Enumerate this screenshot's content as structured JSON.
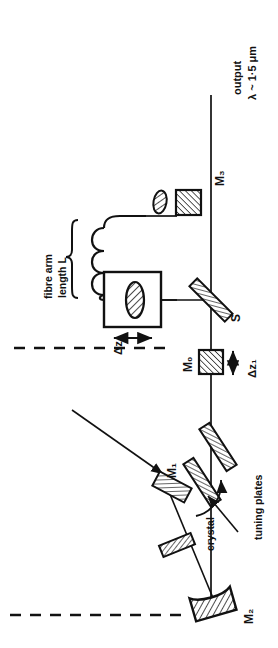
{
  "figure": {
    "kind": "optical-cavity-schematic",
    "orientation": "rotated-90-ccw",
    "background": "#ffffff",
    "ink": "#111111"
  },
  "labels": {
    "output": "output",
    "wavelength": "λ ~ 1·5 μm",
    "mirror_m3": "M₃",
    "mirror_m0": "M₀",
    "mirror_m1": "M₁",
    "mirror_m2": "M₂",
    "beamsplitter_s": "S",
    "fibre_arm_line1": "fibre arm",
    "fibre_arm_line2": "length L",
    "delta_z2": "Δz₂",
    "delta_z1": "Δz₁",
    "crystal": "crystal",
    "tuning_plates": "tuning plates"
  },
  "components": [
    {
      "id": "m3",
      "name": "mirror-m3",
      "label": "M₃",
      "style": "hatched-square"
    },
    {
      "id": "fibre-coil",
      "name": "fibre-coil",
      "label": "fibre arm length L",
      "style": "coil"
    },
    {
      "id": "fibre-endface",
      "name": "fibre-end-element",
      "label": "",
      "style": "hatched-ellipse"
    },
    {
      "id": "dz2-box",
      "name": "translation-stage-z2",
      "label": "Δz₂",
      "style": "box-with-lens"
    },
    {
      "id": "splitter",
      "name": "beamsplitter-s",
      "label": "S",
      "style": "hatched-plate-diagonal"
    },
    {
      "id": "m0",
      "name": "mirror-m0",
      "label": "M₀",
      "style": "hatched-square"
    },
    {
      "id": "tuning1",
      "name": "tuning-plate-1",
      "label": "tuning plates",
      "style": "hatched-plate"
    },
    {
      "id": "tuning2",
      "name": "tuning-plate-2",
      "label": "tuning plates",
      "style": "hatched-plate"
    },
    {
      "id": "m1",
      "name": "mirror-m1",
      "label": "M₁",
      "style": "hatched-plate"
    },
    {
      "id": "crystal",
      "name": "laser-crystal",
      "label": "crystal",
      "style": "hatched-parallelogram"
    },
    {
      "id": "m2",
      "name": "mirror-m2",
      "label": "M₂",
      "style": "hatched-curved-mirror"
    }
  ],
  "beams": {
    "output_arm": "vertical beam exiting top",
    "fibre_arm": "horizontal branch to fibre coil",
    "main_cavity": "vertical beam through tuning plates to M₂",
    "folded_arm": "diagonal beam M₁ - crystal - M₂"
  },
  "guides": {
    "dashed_upper": "optical-axis-dashed-line-upper",
    "dashed_lower": "optical-axis-dashed-line-lower"
  }
}
